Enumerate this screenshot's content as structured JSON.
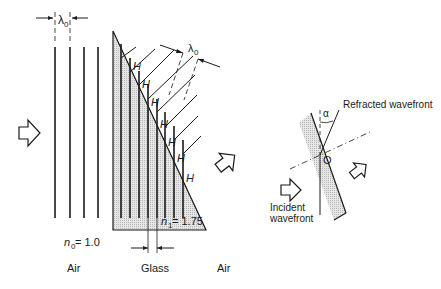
{
  "figure": {
    "left_panel": {
      "lambda_label": "λ",
      "lambda_sub": "0",
      "lambda_tilted_label": "λ",
      "lambda_tilted_sub": "0",
      "n0_label": "n",
      "n0_sub": "0",
      "n0_value": " = 1.0",
      "n1_label": "n",
      "n1_sub": "1",
      "n1_value": " = 1.75",
      "h_marker": "H",
      "region_labels": [
        "Air",
        "Glass",
        "Air"
      ]
    },
    "right_panel": {
      "refracted_label": "Refracted wavefront",
      "incident_label_line1": "Incident",
      "incident_label_line2": "wavefront",
      "point_label": "O",
      "angle_label": "α"
    },
    "colors": {
      "ink": "#1a1a1a",
      "glass_fill": "#d9d9d9"
    }
  }
}
